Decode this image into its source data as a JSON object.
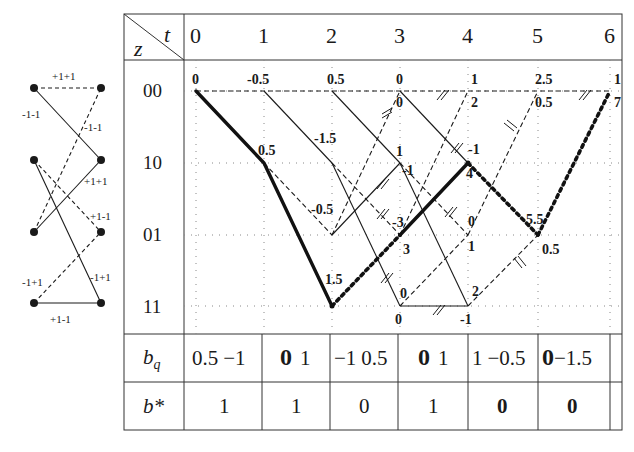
{
  "header": {
    "corner_top": "t",
    "corner_bottom": "z",
    "time_steps": [
      "0",
      "1",
      "2",
      "3",
      "4",
      "5",
      "6"
    ]
  },
  "states": [
    "00",
    "10",
    "01",
    "11"
  ],
  "state_diagram": {
    "labels": {
      "s00_s00": "+1+1",
      "s00_s10": "-1-1",
      "s01_s00": "-1-1",
      "s10_s01": "+1+1",
      "s10_s11": "+1-1",
      "s11_s01": "-1+1",
      "s01_s10": "-1+1",
      "s11_s11": "+1-1"
    }
  },
  "trellis": {
    "metrics": {
      "t0_00": "0",
      "t1_00": "-0.5",
      "t2_00": "0.5",
      "t3_00_top": "0",
      "t3_00_bot": "0",
      "t4_00_top": "1",
      "t4_00_bot": "2",
      "t5_00_top": "2.5",
      "t5_00_bot": "0.5",
      "t6_00_top": "1",
      "t6_00_bot": "7",
      "t1_10": "0.5",
      "t2_10": "-1.5",
      "t3_10_top": "1",
      "t3_10_bot": "-1",
      "t4_10_top": "-1",
      "t4_10_bot": "4",
      "t2_01": "-0.5",
      "t3_01_top": "-3",
      "t3_01_bot": "3",
      "t4_01_top": "0",
      "t4_01_bot": "1",
      "t5_01_top": "5.5",
      "t5_01_bot": "0.5",
      "t2_11": "1.5",
      "t3_11_top": "0",
      "t3_11_bot": "0",
      "t4_11_top": "2",
      "t4_11_bot": "-1"
    }
  },
  "rows": {
    "bq": {
      "label_main": "b",
      "label_sub": "q",
      "cells": [
        {
          "a": "0.5",
          "b": "−1",
          "bold_first": false
        },
        {
          "a": "0",
          "b": "1",
          "bold_first": true
        },
        {
          "a": "−1",
          "b": "0.5",
          "bold_first": false
        },
        {
          "a": "0",
          "b": "1",
          "bold_first": true
        },
        {
          "a": "1",
          "b": "−0.5",
          "bold_first": false
        },
        {
          "a": "0",
          "b": "−1.5",
          "bold_first": true
        }
      ]
    },
    "bstar": {
      "label": "b*",
      "cells": [
        {
          "v": "1",
          "bold": false
        },
        {
          "v": "1",
          "bold": false
        },
        {
          "v": "0",
          "bold": false
        },
        {
          "v": "1",
          "bold": false
        },
        {
          "v": "0",
          "bold": true
        },
        {
          "v": "0",
          "bold": true
        }
      ]
    }
  },
  "colors": {
    "line": "#1a1a1a",
    "grid_dots": "#888888",
    "background": "#ffffff"
  }
}
